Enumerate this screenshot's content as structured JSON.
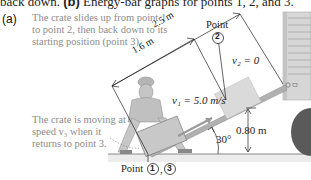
{
  "caption": {
    "prefix": "back down.",
    "bold": "(b)",
    "text": "Energy-bar graphs for points 1, 2, and 3."
  },
  "part_label": "(a)",
  "notes": {
    "top": "The crate slides up from point 1 to point 2, then back down to its starting position (point 3).",
    "bottom": "The crate is moving at speed v₃ when it returns to point 3."
  },
  "dimensions": {
    "ramp_length": "2.5 m",
    "travel_distance": "1.6 m",
    "height": "0.80 m",
    "angle": "30°"
  },
  "labels": {
    "point2_title": "Point",
    "point2_number": "2",
    "v2": "v₂ = 0",
    "v1": "v₁ = 5.0 m/s",
    "point13_title": "Point",
    "point1_number": "1",
    "point3_number": "3",
    "separator": ","
  },
  "colors": {
    "note_text": "#8c8c8c",
    "ramp": "#a9a9a9",
    "crate": "#cfcfcf",
    "truck": "#d6d6d6",
    "wheel": "#555555",
    "ground": "#888888",
    "figure": "#bdbdbd"
  }
}
